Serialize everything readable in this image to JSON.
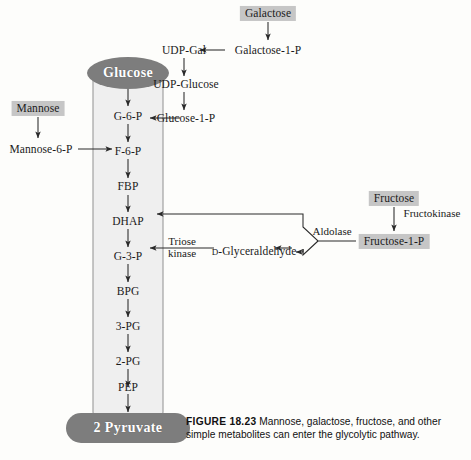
{
  "figure": {
    "number": "FIGURE 18.23",
    "caption": "Mannose, galactose, fructose, and other simple metabolites can enter the glycolytic pathway.",
    "colors": {
      "pill_fill": "#7d7d7d",
      "pill_text": "#ffffff",
      "shaded_box": "#c6c6c6",
      "tube_fill": "#efefef",
      "tube_stroke": "#9a9a9a",
      "arrow": "#2a2a2a",
      "background": "#fdfdfb"
    }
  },
  "glycolysis": {
    "entry_label": "Glucose",
    "exit_label": "2 Pyruvate",
    "intermediates": [
      {
        "id": "g6p",
        "label": "G-6-P"
      },
      {
        "id": "f6p",
        "label": "F-6-P"
      },
      {
        "id": "fbp",
        "label": "FBP"
      },
      {
        "id": "dhap",
        "label": "DHAP"
      },
      {
        "id": "g3p",
        "label": "G-3-P"
      },
      {
        "id": "bpg",
        "label": "BPG"
      },
      {
        "id": "3pg",
        "label": "3-PG"
      },
      {
        "id": "2pg",
        "label": "2-PG"
      },
      {
        "id": "pep",
        "label": "PEP"
      }
    ]
  },
  "mannose_branch": {
    "source_label": "Mannose",
    "intermediate_label": "Mannose-6-P",
    "enters_at": "F-6-P"
  },
  "galactose_branch": {
    "source_label": "Galactose",
    "steps": [
      {
        "id": "gal1p",
        "label": "Galactose-1-P"
      },
      {
        "id": "udpgal",
        "label": "UDP-Gal"
      },
      {
        "id": "udpglc",
        "label": "UDP-Glucose"
      },
      {
        "id": "glc1p",
        "label": "Glucose-1-P"
      }
    ],
    "enters_at": "G-6-P"
  },
  "fructose_branch": {
    "source_label": "Fructose",
    "enzyme_1": "Fructokinase",
    "intermediate_label": "Fructose-1-P",
    "enzyme_2": "Aldolase",
    "product_label": "D-Glyceraldehyde",
    "product_prefix": "D",
    "product_rest": "-Glyceraldehyde",
    "enzyme_3_line1": "Triose",
    "enzyme_3_line2": "kinase",
    "enters_at_upper": "DHAP",
    "enters_at_lower": "G-3-P"
  }
}
